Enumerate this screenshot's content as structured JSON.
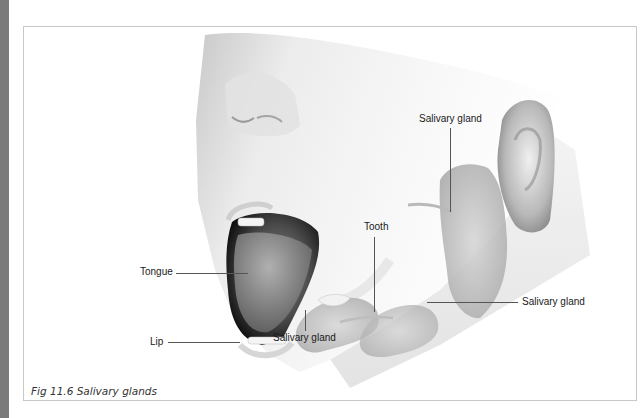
{
  "figure": {
    "caption": "Fig 11.6 Salivary glands",
    "labels": {
      "tongue": "Tongue",
      "lip": "Lip",
      "tooth": "Tooth",
      "salivary_gland_top": "Salivary gland",
      "salivary_gland_right": "Salivary gland",
      "salivary_gland_bottom": "Salivary gland"
    }
  },
  "colors": {
    "left_strip": "#7a7a7a",
    "frame_border": "#c8c8c8",
    "label_text": "#1a1a1a"
  }
}
